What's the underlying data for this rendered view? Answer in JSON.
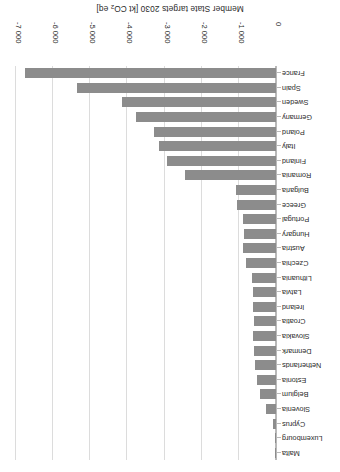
{
  "chart_data": {
    "type": "bar",
    "orientation": "horizontal",
    "title": "",
    "xlabel": "Member State targets 2030 [kt CO2 eq]",
    "xlabel_rich": "Member State targets 2030 [kt CO₂ eq]",
    "ylabel": "",
    "categories": [
      "France",
      "Spain",
      "Sweden",
      "Germany",
      "Poland",
      "Italy",
      "Finland",
      "Romania",
      "Bulgaria",
      "Greece",
      "Portugal",
      "Hungary",
      "Austria",
      "Czechia",
      "Lithuania",
      "Latvia",
      "Ireland",
      "Croatia",
      "Slovakia",
      "Denmark",
      "Netherlands",
      "Estonia",
      "Belgium",
      "Slovenia",
      "Cyprus",
      "Luxembourg",
      "Malta"
    ],
    "values": [
      -6770,
      -5350,
      -4140,
      -3760,
      -3280,
      -3145,
      -2930,
      -2450,
      -1080,
      -1050,
      -890,
      -860,
      -880,
      -810,
      -640,
      -620,
      -615,
      -590,
      -630,
      -580,
      -560,
      -510,
      -420,
      -280,
      -80,
      -40,
      -5
    ],
    "xlim": [
      0,
      -7000
    ],
    "xticks": [
      0,
      -1000,
      -2000,
      -3000,
      -4000,
      -5000,
      -6000,
      -7000
    ],
    "xtick_labels": [
      "0",
      "-1 000",
      "-2 000",
      "-3 000",
      "-4 000",
      "-5 000",
      "-6 000",
      "-7 000"
    ],
    "grid": "vertical",
    "legend": "none",
    "bar_color": "#8c8c8c",
    "gridline_color": "#dcdcdc",
    "axis_color": "#b9b9b9",
    "units": "kt CO2 eq",
    "rotated_180": true
  }
}
